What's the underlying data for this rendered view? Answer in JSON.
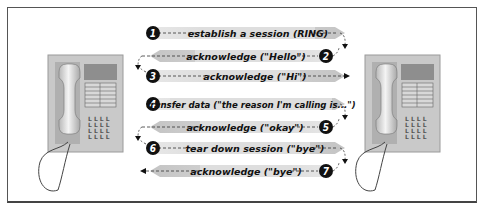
{
  "diagram": {
    "left_node": {
      "label": "phone-caller"
    },
    "right_node": {
      "label": "phone-callee"
    },
    "colors": {
      "arrow_fill": "#cfcfcf",
      "phone_body": "#c9c9c9",
      "display": "#8e8e8e",
      "badge": "#111111",
      "frame": "#555555"
    },
    "steps": [
      {
        "num": "1",
        "label": "establish a session (RING)",
        "direction": "right"
      },
      {
        "num": "2",
        "label": "acknowledge (\"Hello\")",
        "direction": "left"
      },
      {
        "num": "3",
        "label": "acknowledge (\"Hi\")",
        "direction": "right"
      },
      {
        "num": "4",
        "label": "transfer data (\"the reason I'm calling is...\")",
        "direction": "right"
      },
      {
        "num": "5",
        "label": "acknowledge (\"okay\")",
        "direction": "left"
      },
      {
        "num": "6",
        "label": "tear down session (\"bye\")",
        "direction": "right"
      },
      {
        "num": "7",
        "label": "acknowledge (\"bye\")",
        "direction": "left"
      }
    ]
  }
}
